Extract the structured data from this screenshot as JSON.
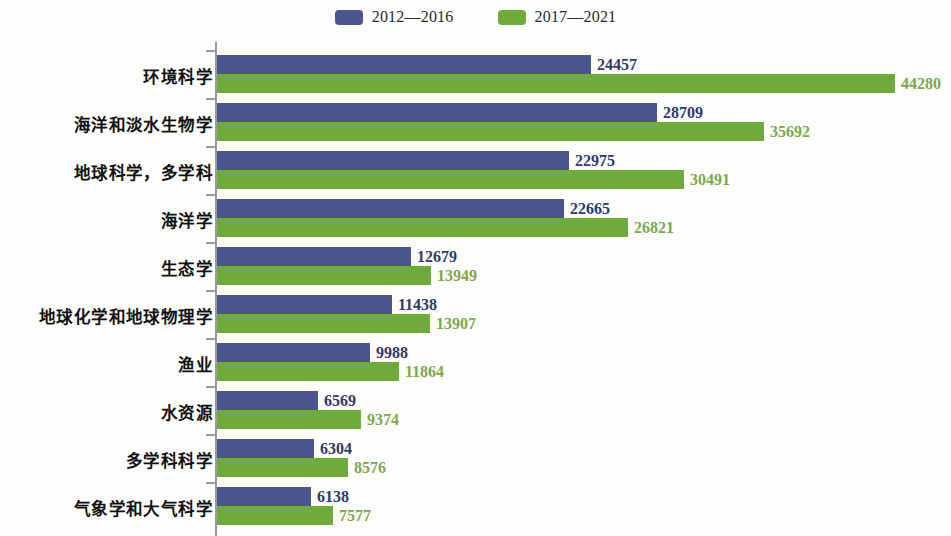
{
  "legend": {
    "entries": [
      {
        "label": "2012—2016",
        "color": "#4a5590",
        "swatch": "blue-swatch"
      },
      {
        "label": "2017—2021",
        "color": "#6fab3a",
        "swatch": "green-swatch"
      }
    ]
  },
  "chart_data": {
    "type": "bar",
    "orientation": "horizontal",
    "title": "",
    "subtitle": "",
    "xlabel": "",
    "ylabel": "",
    "grid": false,
    "legend_position": "top-center",
    "xlim": [
      0,
      44280
    ],
    "axis_visible": true,
    "categories": [
      "环境科学",
      "海洋和淡水生物学",
      "地球科学，多学科",
      "海洋学",
      "生态学",
      "地球化学和地球物理学",
      "渔业",
      "水资源",
      "多学科科学",
      "气象学和大气科学"
    ],
    "series": [
      {
        "name": "2012—2016",
        "color": "#4a5590",
        "values": [
          24457,
          28709,
          22975,
          22665,
          12679,
          11438,
          9988,
          6569,
          6304,
          6138
        ]
      },
      {
        "name": "2017—2021",
        "color": "#6fab3a",
        "values": [
          44280,
          35692,
          30491,
          26821,
          13949,
          13907,
          11864,
          9374,
          8576,
          7577
        ]
      }
    ]
  }
}
